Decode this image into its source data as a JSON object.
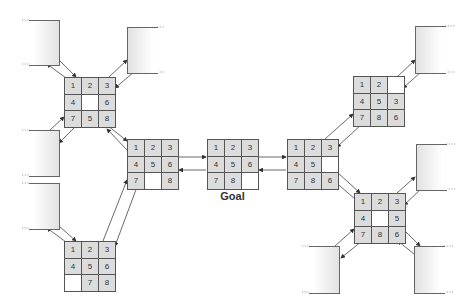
{
  "diagram": {
    "goal_label": "Goal",
    "colors": {
      "tile": "#dcdcdc",
      "blank": "#ffffff",
      "border": "#555555",
      "arrow": "#333333"
    },
    "states": {
      "goal": {
        "tiles": [
          "1",
          "2",
          "3",
          "4",
          "5",
          "6",
          "7",
          "8",
          ""
        ]
      },
      "center_left": {
        "tiles": [
          "1",
          "2",
          "3",
          "4",
          "5",
          "6",
          "7",
          "",
          "8"
        ]
      },
      "top_left": {
        "tiles": [
          "1",
          "2",
          "3",
          "4",
          "",
          "6",
          "7",
          "5",
          "8"
        ]
      },
      "bottom_left": {
        "tiles": [
          "1",
          "2",
          "3",
          "4",
          "5",
          "6",
          "",
          "7",
          "8"
        ]
      },
      "center_right": {
        "tiles": [
          "1",
          "2",
          "3",
          "4",
          "5",
          "",
          "7",
          "8",
          "6"
        ]
      },
      "top_right": {
        "tiles": [
          "1",
          "2",
          "",
          "4",
          "5",
          "3",
          "7",
          "8",
          "6"
        ]
      },
      "bottom_right": {
        "tiles": [
          "1",
          "2",
          "3",
          "4",
          "",
          "5",
          "7",
          "8",
          "6"
        ]
      }
    },
    "placeholder_boxes": 8
  }
}
